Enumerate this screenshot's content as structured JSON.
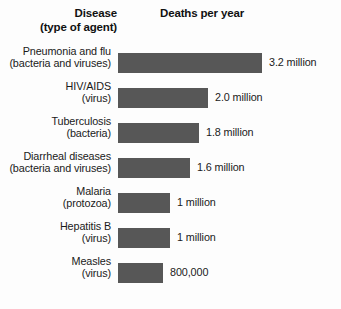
{
  "header": {
    "disease_line1": "Disease",
    "disease_line2": "(type of agent)",
    "deaths": "Deaths per year"
  },
  "style": {
    "bar_color": "#575757",
    "background": "#fdfdfd",
    "text_color": "#1a1a1a"
  },
  "rows": [
    {
      "name_line1": "Pneumonia and flu",
      "name_line2": "(bacteria and viruses)",
      "value_label": "3.2 million",
      "value": 3.2,
      "bar_px": 144
    },
    {
      "name_line1": "HIV/AIDS",
      "name_line2": "(virus)",
      "value_label": "2.0 million",
      "value": 2.0,
      "bar_px": 90
    },
    {
      "name_line1": "Tuberculosis",
      "name_line2": "(bacteria)",
      "value_label": "1.8 million",
      "value": 1.8,
      "bar_px": 81
    },
    {
      "name_line1": "Diarrheal diseases",
      "name_line2": "(bacteria and viruses)",
      "value_label": "1.6 million",
      "value": 1.6,
      "bar_px": 72
    },
    {
      "name_line1": "Malaria",
      "name_line2": "(protozoa)",
      "value_label": "1 million",
      "value": 1.0,
      "bar_px": 52
    },
    {
      "name_line1": "Hepatitis B",
      "name_line2": "(virus)",
      "value_label": "1 million",
      "value": 1.0,
      "bar_px": 52
    },
    {
      "name_line1": "Measles",
      "name_line2": "(virus)",
      "value_label": "800,000",
      "value": 0.8,
      "bar_px": 45
    }
  ],
  "chart_data": {
    "type": "bar",
    "title": "Deaths per year",
    "orientation": "horizontal",
    "xlabel": "Deaths per year",
    "ylabel": "Disease (type of agent)",
    "grid": false,
    "legend": false,
    "units": "deaths per year",
    "categories": [
      "Pneumonia and flu (bacteria and viruses)",
      "HIV/AIDS (virus)",
      "Tuberculosis (bacteria)",
      "Diarrheal diseases (bacteria and viruses)",
      "Malaria (protozoa)",
      "Hepatitis B (virus)",
      "Measles (virus)"
    ],
    "values": [
      3200000,
      2000000,
      1800000,
      1600000,
      1000000,
      1000000,
      800000
    ],
    "value_labels": [
      "3.2 million",
      "2.0 million",
      "1.8 million",
      "1.6 million",
      "1 million",
      "1 million",
      "800,000"
    ],
    "xlim": [
      0,
      3200000
    ]
  }
}
